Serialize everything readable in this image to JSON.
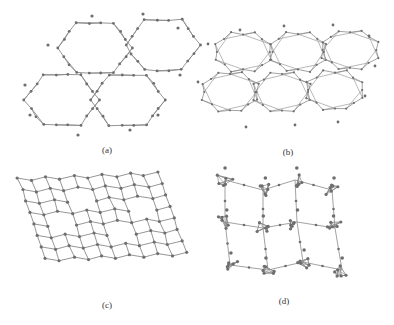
{
  "figure": {
    "panels": [
      {
        "id": "a",
        "label": "(a)",
        "label_x": 107,
        "label_y": 145,
        "type": "hexagonal-ring-network",
        "rings": [
          [
            95,
            48
          ],
          [
            163,
            45
          ],
          [
            62,
            100
          ],
          [
            128,
            100
          ]
        ],
        "ring_r": 30
      },
      {
        "id": "b",
        "label": "(b)",
        "label_x": 288,
        "label_y": 147,
        "type": "corrugated-hexagonal-network",
        "rings": [
          [
            243,
            52
          ],
          [
            298,
            52
          ],
          [
            350,
            50
          ],
          [
            230,
            92
          ],
          [
            282,
            92
          ],
          [
            335,
            90
          ]
        ],
        "ring_r": 26
      },
      {
        "id": "c",
        "label": "(c)",
        "label_x": 107,
        "label_y": 300,
        "type": "square-grid-network",
        "origin": [
          18,
          178
        ],
        "cols": 11,
        "rows": 8,
        "cell": 14
      },
      {
        "id": "d",
        "label": "(d)",
        "label_x": 284,
        "label_y": 296,
        "type": "cluster-linked-network",
        "clusters": [
          [
            225,
            180
          ],
          [
            263,
            190
          ],
          [
            295,
            180
          ],
          [
            332,
            190
          ],
          [
            225,
            222
          ],
          [
            263,
            228
          ],
          [
            297,
            222
          ],
          [
            335,
            228
          ],
          [
            230,
            265
          ],
          [
            268,
            270
          ],
          [
            303,
            262
          ],
          [
            342,
            270
          ]
        ]
      }
    ],
    "style": {
      "bond_color": "#8a8a8a",
      "atom_color": "#6e6e6e",
      "caption_color": "#333333"
    }
  }
}
